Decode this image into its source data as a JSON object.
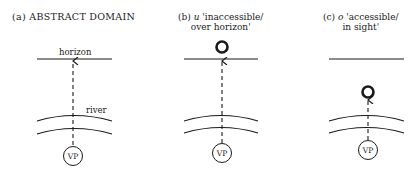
{
  "panels": [
    {
      "id": "a",
      "title_prefix": "(a)",
      "title": "ABSTRACT DOMAIN",
      "labels": {
        "horizon": "horizon",
        "river": "river",
        "viewpoint": "VP"
      },
      "object": "none"
    },
    {
      "id": "b",
      "title_prefix": "(b)",
      "symbol": "u",
      "title_line1": "'inaccessible/",
      "title_line2": "over horizon'",
      "labels": {
        "viewpoint": "VP"
      },
      "object": "circle above horizon"
    },
    {
      "id": "c",
      "title_prefix": "(c)",
      "symbol": "o",
      "title_line1": "'accessible/",
      "title_line2": "in sight'",
      "labels": {
        "viewpoint": "VP"
      },
      "object": "circle below horizon, above river"
    }
  ],
  "colors": {
    "ink": "#1a1a1a",
    "background": "#ffffff"
  }
}
